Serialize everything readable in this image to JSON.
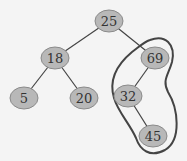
{
  "diagram": {
    "type": "binary-tree",
    "nodes": [
      {
        "id": "n25",
        "label": "25",
        "x": 109,
        "y": 21
      },
      {
        "id": "n18",
        "label": "18",
        "x": 55,
        "y": 58
      },
      {
        "id": "n69",
        "label": "69",
        "x": 155,
        "y": 58
      },
      {
        "id": "n5",
        "label": "5",
        "x": 24,
        "y": 98
      },
      {
        "id": "n20",
        "label": "20",
        "x": 84,
        "y": 98
      },
      {
        "id": "n32",
        "label": "32",
        "x": 128,
        "y": 96
      },
      {
        "id": "n45",
        "label": "45",
        "x": 153,
        "y": 136
      }
    ],
    "edges": [
      [
        "25",
        "18"
      ],
      [
        "25",
        "69"
      ],
      [
        "18",
        "5"
      ],
      [
        "18",
        "20"
      ],
      [
        "69",
        "32"
      ],
      [
        "32",
        "45"
      ]
    ],
    "highlighted_subtree": [
      "69",
      "32",
      "45"
    ],
    "colors": {
      "node_fill": "#b8b8b8",
      "edge": "#444444",
      "background": "#f4f4f4"
    }
  }
}
